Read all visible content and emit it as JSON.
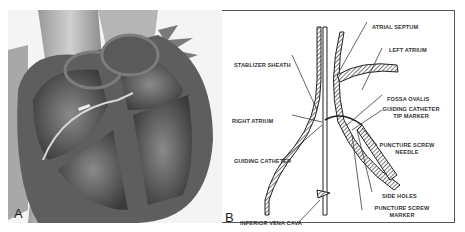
{
  "figure": {
    "panels": [
      {
        "id": "A",
        "label": "A",
        "description": "Cutaway illustration of heart with catheter crossing atrial septum"
      },
      {
        "id": "B",
        "label": "B",
        "description": "Schematic of transseptal puncture device"
      }
    ],
    "labels": {
      "atrial_septum": "ATRIAL SEPTUM",
      "left_atrium": "LEFT ATRIUM",
      "stablizer_sheath": "STABLIZER SHEATH",
      "fossa_ovalis": "FOSSA OVALIS",
      "guiding_catheter_tip_marker_1": "GUIDING CATHETER",
      "guiding_catheter_tip_marker_2": "TIP MARKER",
      "right_atrium": "RIGHT ATRIUM",
      "puncture_screw_needle_1": "PUNCTURE SCREW",
      "puncture_screw_needle_2": "NEEDLE",
      "guiding_catheter": "GUIDING CATHETER",
      "side_holes": "SIDE HOLES",
      "puncture_screw_marker_1": "PUNCTURE SCREW",
      "puncture_screw_marker_2": "MARKER",
      "inferior_vena_cava": "INFERIOR VENA CAVA"
    }
  }
}
